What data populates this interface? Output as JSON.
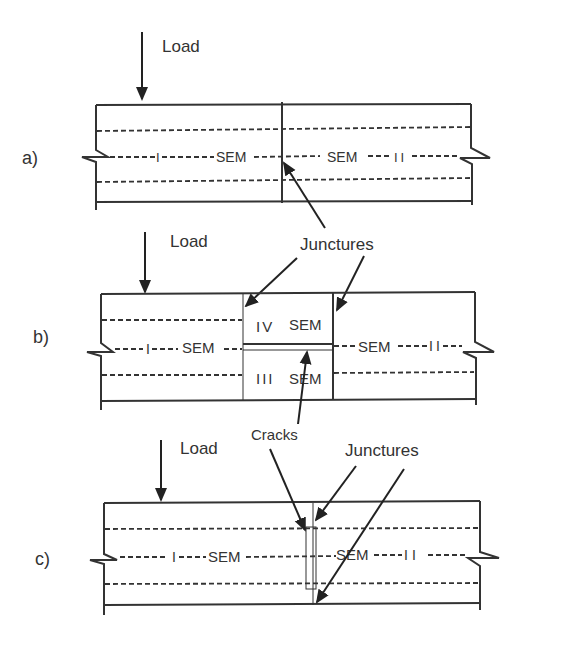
{
  "diagram": {
    "panels": [
      {
        "id": "a",
        "label": "a)",
        "load_label": "Load",
        "left_segment": {
          "roman": "I",
          "text": "SEM"
        },
        "right_segment": {
          "roman": "II",
          "text": "SEM"
        }
      },
      {
        "id": "b",
        "label": "b)",
        "load_label": "Load",
        "left_segment": {
          "roman": "I",
          "text": "SEM"
        },
        "upper_middle_segment": {
          "roman": "IV",
          "text": "SEM"
        },
        "lower_middle_segment": {
          "roman": "III",
          "text": "SEM"
        },
        "right_segment": {
          "roman": "II",
          "text": "SEM"
        }
      },
      {
        "id": "c",
        "label": "c)",
        "load_label": "Load",
        "left_segment": {
          "roman": "I",
          "text": "SEM"
        },
        "right_segment": {
          "roman": "II",
          "text": "SEM"
        }
      }
    ],
    "annotations": {
      "junctures_ab": "Junctures",
      "cracks_bc": "Cracks",
      "junctures_c": "Junctures"
    }
  }
}
